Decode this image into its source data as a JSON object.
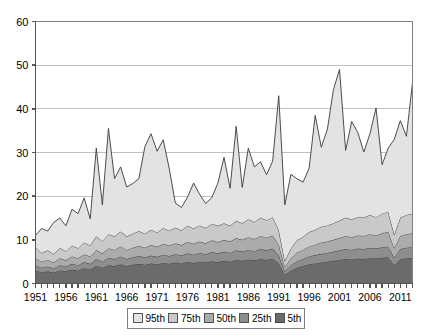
{
  "chart_data": {
    "type": "area",
    "stacked": true,
    "title": "",
    "subtitle": "",
    "xlabel": "",
    "ylabel": "",
    "ylim": [
      0,
      60
    ],
    "yticks": [
      0,
      10,
      20,
      30,
      40,
      50,
      60
    ],
    "xlim": [
      1951,
      2013
    ],
    "xticks": [
      1951,
      1956,
      1961,
      1966,
      1971,
      1976,
      1981,
      1986,
      1991,
      1996,
      2001,
      2006,
      2011
    ],
    "xtick_labels": [
      "1951",
      "1956",
      "1961",
      "1966",
      "1971",
      "1976",
      "1981",
      "1986",
      "1991",
      "1996",
      "2001",
      "2006",
      "2011"
    ],
    "minor_xticks_every": 1,
    "grid": "horizontal",
    "legend_position": "bottom",
    "legend_entries": [
      "95th",
      "75th",
      "50th",
      "25th",
      "5th"
    ],
    "colors": {
      "95th": "#e3e3e3",
      "75th": "#c9c9c9",
      "50th": "#ababab",
      "25th": "#8e8e8e",
      "5th": "#6b6b6b",
      "line": "#3a3a3a",
      "grid": "#c0c0c0",
      "axis": "#808080",
      "plot_background": "#ffffff"
    },
    "x": [
      1951,
      1952,
      1953,
      1954,
      1955,
      1956,
      1957,
      1958,
      1959,
      1960,
      1961,
      1962,
      1963,
      1964,
      1965,
      1966,
      1967,
      1968,
      1969,
      1970,
      1971,
      1972,
      1973,
      1974,
      1975,
      1976,
      1977,
      1978,
      1979,
      1980,
      1981,
      1982,
      1983,
      1984,
      1985,
      1986,
      1987,
      1988,
      1989,
      1990,
      1991,
      1992,
      1993,
      1994,
      1995,
      1996,
      1997,
      1998,
      1999,
      2000,
      2001,
      2002,
      2003,
      2004,
      2005,
      2006,
      2007,
      2008,
      2009,
      2010,
      2011,
      2012,
      2013
    ],
    "series": [
      {
        "name": "5th",
        "order": 1,
        "values": [
          3.0,
          2.6,
          2.8,
          2.5,
          3.0,
          2.8,
          3.2,
          3.0,
          3.5,
          3.2,
          4.0,
          3.6,
          4.2,
          4.0,
          4.4,
          4.0,
          4.3,
          4.5,
          4.3,
          4.6,
          4.4,
          4.7,
          4.5,
          4.8,
          4.6,
          4.9,
          4.7,
          5.0,
          4.8,
          5.1,
          4.9,
          5.2,
          5.0,
          5.4,
          5.2,
          5.5,
          5.3,
          5.6,
          5.4,
          5.7,
          4.6,
          2.0,
          3.0,
          3.6,
          4.0,
          4.4,
          4.6,
          4.8,
          5.0,
          5.2,
          5.4,
          5.6,
          5.5,
          5.7,
          5.6,
          5.8,
          5.7,
          5.9,
          6.0,
          4.2,
          5.6,
          5.8,
          5.9
        ]
      },
      {
        "name": "25th",
        "order": 2,
        "values": [
          1.2,
          1.0,
          1.1,
          1.0,
          1.2,
          1.1,
          1.3,
          1.2,
          1.4,
          1.3,
          1.6,
          1.4,
          1.7,
          1.6,
          1.8,
          1.6,
          1.7,
          1.8,
          1.7,
          1.8,
          1.7,
          1.9,
          1.8,
          1.9,
          1.8,
          2.0,
          1.9,
          2.0,
          1.9,
          2.1,
          2.0,
          2.1,
          2.0,
          2.2,
          2.1,
          2.2,
          2.1,
          2.3,
          2.2,
          2.3,
          1.9,
          0.8,
          1.2,
          1.5,
          1.6,
          1.8,
          1.9,
          2.0,
          2.0,
          2.1,
          2.2,
          2.3,
          2.2,
          2.3,
          2.3,
          2.4,
          2.3,
          2.4,
          2.5,
          1.7,
          2.3,
          2.4,
          2.4
        ]
      },
      {
        "name": "50th",
        "order": 3,
        "values": [
          1.6,
          1.4,
          1.5,
          1.3,
          1.6,
          1.4,
          1.7,
          1.6,
          1.8,
          1.7,
          2.1,
          1.9,
          2.2,
          2.1,
          2.3,
          2.1,
          2.2,
          2.3,
          2.2,
          2.4,
          2.3,
          2.5,
          2.4,
          2.5,
          2.4,
          2.6,
          2.5,
          2.6,
          2.5,
          2.7,
          2.6,
          2.7,
          2.6,
          2.8,
          2.7,
          2.9,
          2.8,
          3.0,
          2.9,
          3.0,
          2.4,
          1.0,
          1.6,
          2.0,
          2.1,
          2.3,
          2.4,
          2.6,
          2.6,
          2.7,
          2.8,
          3.0,
          2.9,
          3.0,
          3.0,
          3.1,
          3.0,
          3.2,
          3.3,
          2.2,
          3.0,
          3.1,
          3.2
        ]
      },
      {
        "name": "75th",
        "order": 4,
        "values": [
          2.4,
          2.0,
          2.2,
          1.9,
          2.4,
          2.1,
          2.5,
          2.3,
          2.7,
          2.5,
          3.1,
          2.8,
          3.2,
          3.1,
          3.4,
          3.1,
          3.2,
          3.4,
          3.2,
          3.5,
          3.3,
          3.6,
          3.4,
          3.6,
          3.4,
          3.7,
          3.5,
          3.7,
          3.5,
          3.8,
          3.7,
          3.8,
          3.6,
          4.0,
          3.8,
          4.1,
          3.9,
          4.2,
          4.0,
          4.2,
          3.4,
          1.4,
          2.2,
          2.8,
          3.0,
          3.3,
          3.4,
          3.6,
          3.7,
          3.8,
          4.0,
          4.2,
          4.1,
          4.2,
          4.2,
          4.4,
          4.2,
          4.5,
          4.6,
          3.1,
          4.2,
          4.4,
          4.5
        ]
      },
      {
        "name": "95th",
        "order": 5,
        "values": [
          2.8,
          5.6,
          4.4,
          7.3,
          6.8,
          5.8,
          8.3,
          7.9,
          10.2,
          6.1,
          20.2,
          8.3,
          24.2,
          13.2,
          14.8,
          11.3,
          11.5,
          12.0,
          20.0,
          22.0,
          18.6,
          20.2,
          14.2,
          5.6,
          5.2,
          6.6,
          10.4,
          7.1,
          5.6,
          6.0,
          9.8,
          15.1,
          8.6,
          21.6,
          8.2,
          16.3,
          12.6,
          12.8,
          10.4,
          12.8,
          30.7,
          12.8,
          17.0,
          14.1,
          12.5,
          14.6,
          26.2,
          18.2,
          22.0,
          30.6,
          34.6,
          15.4,
          22.4,
          19.4,
          15.0,
          18.6,
          25.0,
          11.2,
          14.6,
          21.8,
          22.2,
          18.0,
          30.0
        ]
      }
    ],
    "totals": [
      11.0,
      12.6,
      12.0,
      14.0,
      15.0,
      13.2,
      17.0,
      16.0,
      19.6,
      14.8,
      31.0,
      18.0,
      35.5,
      24.0,
      26.7,
      22.1,
      22.9,
      24.0,
      31.4,
      34.3,
      30.3,
      32.9,
      26.3,
      18.4,
      17.4,
      19.8,
      23.0,
      20.4,
      18.3,
      19.7,
      23.0,
      28.9,
      21.8,
      37.0,
      22.0,
      31.0,
      26.7,
      27.9,
      24.9,
      28.0,
      43.0,
      18.0,
      25.0,
      24.0,
      23.2,
      26.4,
      38.5,
      31.2,
      35.3,
      44.4,
      49.0,
      30.5,
      38.6,
      34.6,
      30.1,
      34.3,
      40.2,
      27.2,
      31.4,
      33.0,
      37.3,
      33.7,
      46.0
    ]
  }
}
